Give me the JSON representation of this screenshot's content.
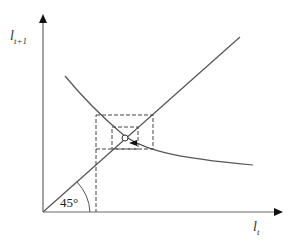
{
  "diagram": {
    "type": "cobweb",
    "y_axis_label": {
      "base": "l",
      "sub": "t+1"
    },
    "x_axis_label": {
      "base": "l",
      "sub": "t"
    },
    "angle_label": "45°",
    "colors": {
      "line": "#555555",
      "dashed": "#444444",
      "axis": "#666666"
    },
    "elements": [
      "45-degree line",
      "downward-sloping curve",
      "outer dashed rectangle",
      "inner dashed rectangle",
      "equilibrium point",
      "arrow pointing left"
    ]
  }
}
